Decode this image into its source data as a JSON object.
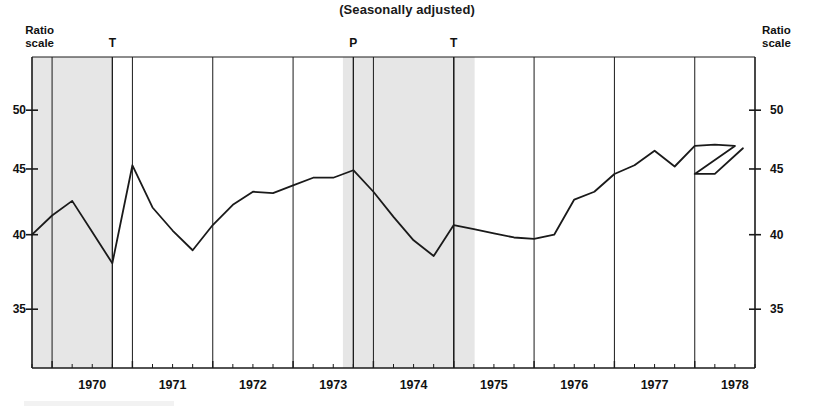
{
  "title": "(Seasonally adjusted)",
  "axis_caption_left": "Ratio\nscale",
  "axis_caption_right": "Ratio\nscale",
  "markers": [
    {
      "label": "T",
      "x_year": 1970.75
    },
    {
      "label": "P",
      "x_year": 1973.75
    },
    {
      "label": "T",
      "x_year": 1975.0
    }
  ],
  "colors": {
    "line": "#1a1a1a",
    "axis": "#1a1a1a",
    "shading": "#e6e6e6",
    "text": "#111111",
    "background": "#ffffff"
  },
  "chart_data": {
    "type": "line",
    "title": "(Seasonally adjusted)",
    "xlabel": "",
    "ylabel": "Ratio scale",
    "yscale": "ratio",
    "ylim": [
      31.5,
      55
    ],
    "xlim": [
      1969.75,
      1978.75
    ],
    "grid": false,
    "legend": "none",
    "ytick_labels": [
      "50",
      "45",
      "40",
      "35"
    ],
    "yticks": [
      50,
      45,
      40,
      35
    ],
    "xtick_labels": [
      "1970",
      "1971",
      "1972",
      "1973",
      "1974",
      "1975",
      "1976",
      "1977",
      "1978"
    ],
    "xticks": [
      1970,
      1971,
      1972,
      1973,
      1974,
      1975,
      1976,
      1977,
      1978
    ],
    "minor_xticks_per_year": 4,
    "annotations": [
      {
        "text": "T",
        "x": 1970.75,
        "note": "business cycle trough"
      },
      {
        "text": "P",
        "x": 1973.75,
        "note": "business cycle peak"
      },
      {
        "text": "T",
        "x": 1975.0,
        "note": "business cycle trough"
      }
    ],
    "shaded_regions": [
      {
        "x0": 1969.75,
        "x1": 1970.75,
        "label": "recession"
      },
      {
        "x0": 1973.62,
        "x1": 1975.26,
        "label": "recession"
      }
    ],
    "x": [
      1969.75,
      1970.0,
      1970.25,
      1970.5,
      1970.75,
      1971.0,
      1971.25,
      1971.5,
      1971.75,
      1972.0,
      1972.25,
      1972.5,
      1972.75,
      1973.0,
      1973.25,
      1973.5,
      1973.75,
      1974.0,
      1974.25,
      1974.5,
      1974.75,
      1975.0,
      1975.25,
      1975.5,
      1975.75,
      1976.0,
      1976.25,
      1976.5,
      1976.75,
      1977.0,
      1977.25,
      1977.5,
      1977.75,
      1978.0,
      1978.25,
      1978.5
    ],
    "values": [
      40.0,
      41.4,
      42.5,
      40.2,
      38.0,
      45.3,
      42.0,
      40.3,
      38.9,
      40.7,
      42.2,
      43.2,
      43.1,
      43.7,
      44.3,
      44.3,
      44.9,
      43.2,
      41.3,
      39.6,
      38.5,
      40.7,
      40.4,
      40.1,
      39.8,
      39.7,
      40.0,
      42.6,
      43.2,
      44.6,
      45.3,
      46.5,
      45.2,
      46.9,
      47.0,
      46.9
    ],
    "values_tail": [
      44.6,
      44.6,
      46.7
    ],
    "x_tail": [
      1978.0,
      1978.25,
      1978.6
    ]
  }
}
